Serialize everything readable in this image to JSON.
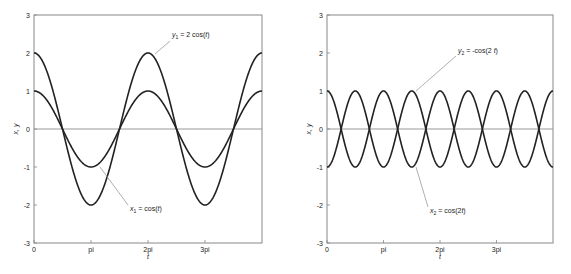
{
  "chart_data": [
    {
      "type": "line",
      "title": "",
      "xlabel": "t",
      "ylabel": "x, y",
      "xlim": [
        0,
        12.566
      ],
      "ylim": [
        -3,
        3
      ],
      "x_ticks": [
        {
          "value": 0,
          "label": "0"
        },
        {
          "value": 3.1416,
          "label": "pi"
        },
        {
          "value": 6.2832,
          "label": "2pi"
        },
        {
          "value": 9.4248,
          "label": "3pi"
        }
      ],
      "y_ticks": [
        -3,
        -2,
        -1,
        0,
        1,
        2,
        3
      ],
      "grid": false,
      "zero_line": true,
      "series": [
        {
          "name": "x_1 = cos(t)",
          "function": "cos(t)",
          "amplitude": 1,
          "frequency": 1,
          "sign": 1
        },
        {
          "name": "y_1 = 2 cos(t)",
          "function": "2 cos(t)",
          "amplitude": 2,
          "frequency": 1,
          "sign": 1
        }
      ],
      "annotations": [
        {
          "text_base": "y",
          "text_sub": "1",
          "text_rest": " = 2 cos(",
          "text_var": "t",
          "text_end": ")",
          "points_to": "y_1 = 2 cos(t) at t=2pi"
        },
        {
          "text_base": "x",
          "text_sub": "1",
          "text_rest": " = cos(",
          "text_var": "t",
          "text_end": ")",
          "points_to": "x_1 = cos(t) at t=pi"
        }
      ]
    },
    {
      "type": "line",
      "title": "",
      "xlabel": "t",
      "ylabel": "x, y",
      "xlim": [
        0,
        12.566
      ],
      "ylim": [
        -3,
        3
      ],
      "x_ticks": [
        {
          "value": 0,
          "label": "0"
        },
        {
          "value": 3.1416,
          "label": "pi"
        },
        {
          "value": 6.2832,
          "label": "2pi"
        },
        {
          "value": 9.4248,
          "label": "3pi"
        }
      ],
      "y_ticks": [
        -3,
        -2,
        -1,
        0,
        1,
        2,
        3
      ],
      "grid": false,
      "zero_line": true,
      "series": [
        {
          "name": "x_2 = cos(2t)",
          "function": "cos(2t)",
          "amplitude": 1,
          "frequency": 2,
          "sign": 1
        },
        {
          "name": "y_2 = -cos(2 t)",
          "function": "-cos(2t)",
          "amplitude": 1,
          "frequency": 2,
          "sign": -1
        }
      ],
      "annotations": [
        {
          "text_base": "y",
          "text_sub": "2",
          "text_rest": " = -cos(2 ",
          "text_var": "t",
          "text_end": ")",
          "points_to": "y_2 = -cos(2t) at t=3pi/2"
        },
        {
          "text_base": "x",
          "text_sub": "2",
          "text_rest": " = cos(2",
          "text_var": "t",
          "text_end": ")",
          "points_to": "x_2 = cos(2t) at t=3pi/2"
        }
      ]
    }
  ]
}
